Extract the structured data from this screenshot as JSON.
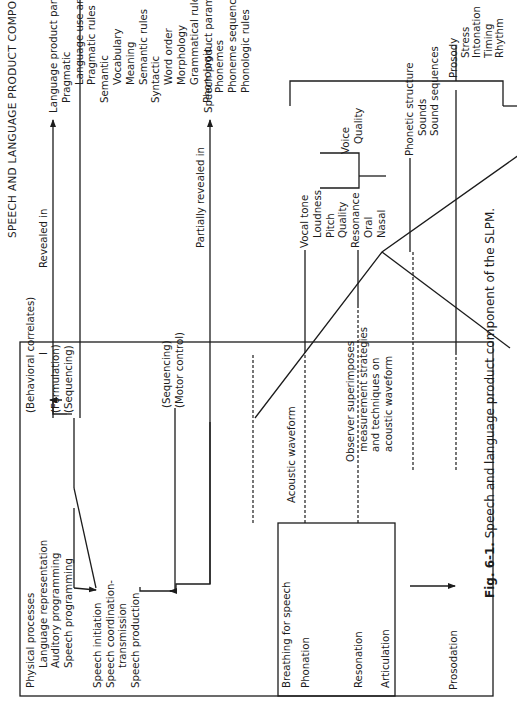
{
  "title": "SPEECH AND LANGUAGE PRODUCT COMPONENT",
  "left_box": {
    "physical_processes": [
      "Physical processes",
      "Language representation",
      "Auditory programming",
      "Speech programming"
    ],
    "behavioral_correlates": [
      "(Behavioral correlates)",
      "I",
      "(Formulation)",
      "(Sequencing)"
    ],
    "speech_processes": [
      "Speech initiation",
      "Speech coordination-",
      "transmission",
      "Speech production"
    ],
    "motor_labels": [
      "(Sequencing)",
      "(Motor control)"
    ],
    "inner_box": {
      "breathing": "Breathing for speech",
      "phonation": "Phonation",
      "resonation": "Resonation",
      "articulation": "Articulation"
    },
    "prosodation": "Prosodation"
  },
  "arrows": {
    "revealed_in": "Revealed in",
    "partially_revealed_in": "Partially revealed in"
  },
  "language_parameters": [
    {
      "text": "Language product parameters",
      "level": 0
    },
    {
      "text": "Pragmatic",
      "level": 1
    },
    {
      "text": "Language use and focus",
      "level": 2
    },
    {
      "text": "Pragmatic rules",
      "level": 2
    },
    {
      "text": "Semantic",
      "level": 1
    },
    {
      "text": "Vocabulary",
      "level": 2
    },
    {
      "text": "Meaning",
      "level": 2
    },
    {
      "text": "Semantic rules",
      "level": 2
    },
    {
      "text": "Syntactic",
      "level": 1
    },
    {
      "text": "Word order",
      "level": 2
    },
    {
      "text": "Morphology",
      "level": 2
    },
    {
      "text": "Grammatical rules",
      "level": 2
    },
    {
      "text": "Phonologic",
      "level": 1
    },
    {
      "text": "Phonemes",
      "level": 2
    },
    {
      "text": "Phoneme sequences",
      "level": 2
    },
    {
      "text": "Phonologic rules",
      "level": 2
    }
  ],
  "speech_parameters_label": "Speech product parameters",
  "waveform": {
    "acoustic_waveform": "Acoustic waveform",
    "observer": [
      "Observer superimposes",
      "measurement strategies",
      "and techniques on",
      "acoustic waveform"
    ]
  },
  "vocal": [
    {
      "text": "Vocal tone",
      "level": 0
    },
    {
      "text": "Loudness",
      "level": 1
    },
    {
      "text": "Pitch",
      "level": 1
    },
    {
      "text": "Quality",
      "level": 1
    },
    {
      "text": "Resonance",
      "level": 0
    },
    {
      "text": "Oral",
      "level": 1
    },
    {
      "text": "Nasal",
      "level": 1
    }
  ],
  "voice_quality": [
    "Voice",
    "Quality"
  ],
  "phonetic": [
    {
      "text": "Phonetic structure",
      "level": 0
    },
    {
      "text": "Sounds",
      "level": 1
    },
    {
      "text": "Sound sequences",
      "level": 1
    }
  ],
  "prosody": [
    {
      "text": "Prosody",
      "level": 0
    },
    {
      "text": "Stress",
      "level": 1
    },
    {
      "text": "Intonation",
      "level": 1
    },
    {
      "text": "Timing",
      "level": 1
    },
    {
      "text": "Rhythm",
      "level": 1
    }
  ],
  "caption": {
    "label": "Fig. 6-1.",
    "text": " Speech and language product component of the SLPM."
  }
}
